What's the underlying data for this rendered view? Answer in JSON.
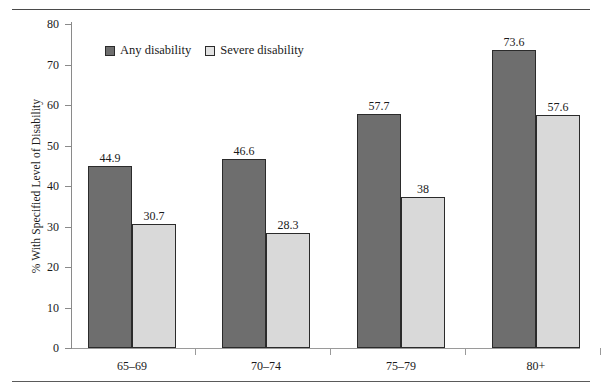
{
  "chart_data": {
    "type": "bar",
    "title": "",
    "xlabel": "",
    "ylabel": "% With Specified Level of Disability",
    "categories": [
      "65–69",
      "70–74",
      "75–79",
      "80+"
    ],
    "series": [
      {
        "name": "Any disability",
        "color": "#6e6e6e",
        "values": [
          44.9,
          46.6,
          57.7,
          73.6
        ],
        "labels": [
          "44.9",
          "46.6",
          "57.7",
          "73.6"
        ]
      },
      {
        "name": "Severe disability",
        "color": "#d9d9d9",
        "values": [
          30.7,
          28.3,
          37.4,
          57.6
        ],
        "labels": [
          "30.7",
          "28.3",
          "38",
          "57.6"
        ]
      }
    ],
    "ylim": [
      0,
      80
    ],
    "yticks": [
      0,
      10,
      20,
      30,
      40,
      50,
      60,
      70,
      80
    ],
    "ytick_labels": [
      "0",
      "10",
      "20",
      "30",
      "40",
      "50",
      "60",
      "70",
      "80"
    ],
    "grid": false,
    "legend_position": "top-left-inside"
  },
  "legend": {
    "items": [
      {
        "label": "Any disability",
        "swatch": "dark-gray-swatch-icon"
      },
      {
        "label": "Severe disability",
        "swatch": "light-gray-swatch-icon"
      }
    ]
  }
}
